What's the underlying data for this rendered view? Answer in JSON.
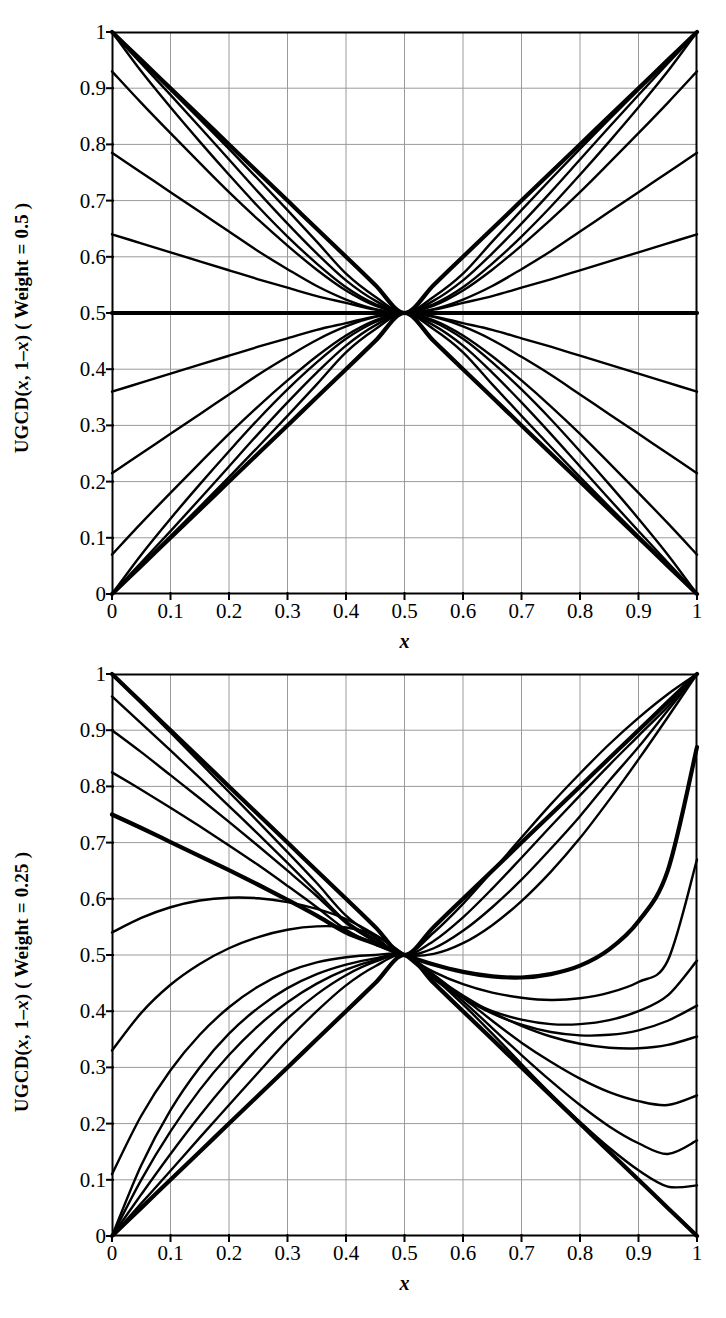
{
  "figures": [
    {
      "id": "top",
      "ylabel_prefix": "UGCD(",
      "ylabel_args_a": "x",
      "ylabel_comma": ", 1–",
      "ylabel_args_b": "x",
      "ylabel_suffix": ") ( Weight = 0.5 )",
      "xlabel": "x",
      "weight": "0.5"
    },
    {
      "id": "bottom",
      "ylabel_prefix": "UGCD(",
      "ylabel_args_a": "x",
      "ylabel_comma": ", 1–",
      "ylabel_args_b": "x",
      "ylabel_suffix": ") ( Weight = 0.25 )",
      "xlabel": "x",
      "weight": "0.25"
    }
  ],
  "axis": {
    "xticks": [
      "0",
      "0.1",
      "0.2",
      "0.3",
      "0.4",
      "0.5",
      "0.6",
      "0.7",
      "0.8",
      "0.9",
      "1"
    ],
    "yticks": [
      "0",
      "0.1",
      "0.2",
      "0.3",
      "0.4",
      "0.5",
      "0.6",
      "0.7",
      "0.8",
      "0.9",
      "1"
    ],
    "xlim": [
      0,
      1
    ],
    "ylim": [
      0,
      1
    ],
    "grid": true,
    "gridcolor": "#9a9a9a",
    "axiscolor": "#000000",
    "linecolor": "#000000"
  },
  "chart_data": [
    {
      "type": "line",
      "title": "",
      "xlabel": "x",
      "ylabel": "UGCD( x, 1–x ) ( Weight = 0.5 )",
      "xlim": [
        0,
        1
      ],
      "ylim": [
        0,
        1
      ],
      "grid": true,
      "legend": "none",
      "note": "Family of UGCD(x,1-x) aggregation curves for weight 0.5; all curves pass through the fixed point (0.5, 0.5). Curves are symmetric: the upper half descends from near (0,1) and the lower half rises from near (0,0).",
      "fixed_point": [
        0.5,
        0.5
      ],
      "x": [
        0,
        0.05,
        0.1,
        0.15,
        0.2,
        0.25,
        0.3,
        0.35,
        0.4,
        0.45,
        0.5,
        0.55,
        0.6,
        0.65,
        0.7,
        0.75,
        0.8,
        0.85,
        0.9,
        0.95,
        1
      ],
      "series": [
        {
          "name": "d-1 (pure disjunction, upper diagonal)",
          "thick": true,
          "values": [
            1,
            0.95,
            0.9,
            0.85,
            0.8,
            0.75,
            0.7,
            0.65,
            0.6,
            0.55,
            0.5,
            0.55,
            0.6,
            0.65,
            0.7,
            0.75,
            0.8,
            0.85,
            0.9,
            0.95,
            1
          ]
        },
        {
          "name": "d-2",
          "thick": false,
          "values": [
            1,
            0.949,
            0.897,
            0.845,
            0.792,
            0.738,
            0.683,
            0.627,
            0.57,
            0.529,
            0.5,
            0.529,
            0.57,
            0.627,
            0.683,
            0.738,
            0.792,
            0.845,
            0.897,
            0.949,
            1
          ]
        },
        {
          "name": "d-3",
          "thick": false,
          "values": [
            1,
            0.944,
            0.888,
            0.831,
            0.773,
            0.715,
            0.659,
            0.606,
            0.558,
            0.522,
            0.5,
            0.522,
            0.558,
            0.606,
            0.659,
            0.715,
            0.773,
            0.831,
            0.888,
            0.944,
            1
          ]
        },
        {
          "name": "d-4",
          "thick": false,
          "values": [
            1,
            0.93,
            0.866,
            0.805,
            0.746,
            0.689,
            0.636,
            0.588,
            0.546,
            0.516,
            0.5,
            0.516,
            0.546,
            0.588,
            0.636,
            0.689,
            0.746,
            0.805,
            0.866,
            0.93,
            1
          ]
        },
        {
          "name": "d-5",
          "thick": false,
          "values": [
            0.93,
            0.874,
            0.82,
            0.767,
            0.715,
            0.666,
            0.62,
            0.577,
            0.54,
            0.513,
            0.5,
            0.513,
            0.54,
            0.577,
            0.62,
            0.666,
            0.715,
            0.767,
            0.82,
            0.874,
            0.93
          ]
        },
        {
          "name": "d-6",
          "thick": false,
          "values": [
            0.785,
            0.75,
            0.715,
            0.68,
            0.645,
            0.61,
            0.578,
            0.548,
            0.524,
            0.507,
            0.5,
            0.507,
            0.524,
            0.548,
            0.578,
            0.61,
            0.645,
            0.68,
            0.715,
            0.75,
            0.785
          ]
        },
        {
          "name": "d-7",
          "thick": false,
          "values": [
            0.64,
            0.624,
            0.608,
            0.592,
            0.576,
            0.56,
            0.545,
            0.53,
            0.518,
            0.506,
            0.5,
            0.506,
            0.518,
            0.53,
            0.545,
            0.56,
            0.576,
            0.592,
            0.608,
            0.624,
            0.64
          ]
        },
        {
          "name": "neutral (constant 0.5)",
          "thick": true,
          "values": [
            0.5,
            0.5,
            0.5,
            0.5,
            0.5,
            0.5,
            0.5,
            0.5,
            0.5,
            0.5,
            0.5,
            0.5,
            0.5,
            0.5,
            0.5,
            0.5,
            0.5,
            0.5,
            0.5,
            0.5,
            0.5
          ]
        },
        {
          "name": "c-7",
          "thick": false,
          "values": [
            0.36,
            0.376,
            0.392,
            0.408,
            0.424,
            0.44,
            0.455,
            0.47,
            0.482,
            0.494,
            0.5,
            0.494,
            0.482,
            0.47,
            0.455,
            0.44,
            0.424,
            0.408,
            0.392,
            0.376,
            0.36
          ]
        },
        {
          "name": "c-6",
          "thick": false,
          "values": [
            0.215,
            0.25,
            0.285,
            0.32,
            0.355,
            0.39,
            0.422,
            0.452,
            0.476,
            0.493,
            0.5,
            0.493,
            0.476,
            0.452,
            0.422,
            0.39,
            0.355,
            0.32,
            0.285,
            0.25,
            0.215
          ]
        },
        {
          "name": "c-5",
          "thick": false,
          "values": [
            0.07,
            0.126,
            0.18,
            0.233,
            0.285,
            0.334,
            0.38,
            0.423,
            0.46,
            0.487,
            0.5,
            0.487,
            0.46,
            0.423,
            0.38,
            0.334,
            0.285,
            0.233,
            0.18,
            0.126,
            0.07
          ]
        },
        {
          "name": "c-4",
          "thick": false,
          "values": [
            0,
            0.07,
            0.134,
            0.195,
            0.254,
            0.311,
            0.364,
            0.412,
            0.454,
            0.484,
            0.5,
            0.484,
            0.454,
            0.412,
            0.364,
            0.311,
            0.254,
            0.195,
            0.134,
            0.07,
            0
          ]
        },
        {
          "name": "c-3",
          "thick": false,
          "values": [
            0,
            0.056,
            0.112,
            0.169,
            0.227,
            0.285,
            0.341,
            0.394,
            0.442,
            0.478,
            0.5,
            0.478,
            0.442,
            0.394,
            0.341,
            0.285,
            0.227,
            0.169,
            0.112,
            0.056,
            0
          ]
        },
        {
          "name": "c-2",
          "thick": false,
          "values": [
            0,
            0.051,
            0.103,
            0.155,
            0.208,
            0.262,
            0.317,
            0.373,
            0.43,
            0.471,
            0.5,
            0.471,
            0.43,
            0.373,
            0.317,
            0.262,
            0.208,
            0.155,
            0.103,
            0.051,
            0
          ]
        },
        {
          "name": "c-1 (pure conjunction, lower diagonal)",
          "thick": true,
          "values": [
            0,
            0.05,
            0.1,
            0.15,
            0.2,
            0.25,
            0.3,
            0.35,
            0.4,
            0.45,
            0.5,
            0.45,
            0.4,
            0.35,
            0.3,
            0.25,
            0.2,
            0.15,
            0.1,
            0.05,
            0
          ]
        }
      ]
    },
    {
      "type": "line",
      "title": "",
      "xlabel": "x",
      "ylabel": "UGCD( x, 1–x ) ( Weight = 0.25 )",
      "xlim": [
        0,
        1
      ],
      "ylim": [
        0,
        1
      ],
      "grid": true,
      "legend": "none",
      "note": "Family of UGCD(x,1-x) aggregation curves for weight 0.25; all curves pass through the fixed point (0.5, 0.5). Asymmetric weighting produces descending straight-ish lines from the upper left and hump/valley shaped curves.",
      "fixed_point": [
        0.5,
        0.5
      ],
      "x": [
        0,
        0.05,
        0.1,
        0.15,
        0.2,
        0.25,
        0.3,
        0.35,
        0.4,
        0.45,
        0.5,
        0.55,
        0.6,
        0.65,
        0.7,
        0.75,
        0.8,
        0.85,
        0.9,
        0.95,
        1
      ],
      "series": [
        {
          "name": "d-1 (upper diagonal)",
          "thick": true,
          "values": [
            1,
            0.95,
            0.9,
            0.85,
            0.8,
            0.75,
            0.7,
            0.65,
            0.6,
            0.55,
            0.5,
            0.55,
            0.6,
            0.65,
            0.7,
            0.75,
            0.8,
            0.85,
            0.9,
            0.95,
            1
          ]
        },
        {
          "name": "d-2",
          "thick": false,
          "values": [
            1,
            0.948,
            0.896,
            0.843,
            0.79,
            0.737,
            0.683,
            0.628,
            0.57,
            0.532,
            0.5,
            0.54,
            0.591,
            0.649,
            0.709,
            0.768,
            0.823,
            0.875,
            0.922,
            0.964,
            1
          ]
        },
        {
          "name": "d-3",
          "thick": false,
          "values": [
            0.96,
            0.912,
            0.864,
            0.815,
            0.765,
            0.715,
            0.664,
            0.612,
            0.56,
            0.528,
            0.5,
            0.525,
            0.567,
            0.618,
            0.673,
            0.729,
            0.784,
            0.838,
            0.89,
            0.942,
            1
          ]
        },
        {
          "name": "d-4",
          "thick": false,
          "values": [
            0.9,
            0.861,
            0.82,
            0.779,
            0.737,
            0.694,
            0.65,
            0.605,
            0.557,
            0.524,
            0.5,
            0.512,
            0.543,
            0.585,
            0.634,
            0.689,
            0.747,
            0.81,
            0.87,
            0.935,
            1
          ]
        },
        {
          "name": "d-5",
          "thick": false,
          "values": [
            0.825,
            0.794,
            0.762,
            0.729,
            0.695,
            0.66,
            0.623,
            0.585,
            0.545,
            0.519,
            0.5,
            0.502,
            0.521,
            0.553,
            0.596,
            0.648,
            0.708,
            0.776,
            0.848,
            0.923,
            1
          ]
        },
        {
          "name": "d-6 (thick, from 0.75)",
          "thick": true,
          "values": [
            0.75,
            0.726,
            0.701,
            0.676,
            0.651,
            0.625,
            0.598,
            0.57,
            0.54,
            0.52,
            0.5,
            0.483,
            0.47,
            0.462,
            0.46,
            0.466,
            0.481,
            0.51,
            0.56,
            0.65,
            0.87
          ]
        },
        {
          "name": "h-1 (hump from 0.54)",
          "thick": false,
          "values": [
            0.54,
            0.566,
            0.585,
            0.597,
            0.602,
            0.601,
            0.594,
            0.582,
            0.564,
            0.536,
            0.5,
            0.47,
            0.448,
            0.433,
            0.424,
            0.42,
            0.423,
            0.433,
            0.452,
            0.49,
            0.67
          ]
        },
        {
          "name": "h-2 (hump from 0.33)",
          "thick": false,
          "values": [
            0.33,
            0.397,
            0.447,
            0.484,
            0.512,
            0.532,
            0.545,
            0.551,
            0.549,
            0.535,
            0.5,
            0.457,
            0.424,
            0.4,
            0.385,
            0.377,
            0.377,
            0.384,
            0.4,
            0.428,
            0.49
          ]
        },
        {
          "name": "h-3 (hump from 0.11)",
          "thick": false,
          "values": [
            0.11,
            0.214,
            0.295,
            0.358,
            0.407,
            0.444,
            0.47,
            0.487,
            0.496,
            0.5,
            0.5,
            0.459,
            0.424,
            0.396,
            0.376,
            0.363,
            0.357,
            0.358,
            0.366,
            0.383,
            0.41
          ]
        },
        {
          "name": "h-4 (hump from 0)",
          "thick": false,
          "values": [
            0,
            0.126,
            0.224,
            0.3,
            0.36,
            0.406,
            0.441,
            0.466,
            0.483,
            0.494,
            0.5,
            0.462,
            0.428,
            0.398,
            0.374,
            0.355,
            0.342,
            0.335,
            0.334,
            0.34,
            0.355
          ]
        },
        {
          "name": "c-4",
          "thick": false,
          "values": [
            0,
            0.1,
            0.186,
            0.26,
            0.322,
            0.374,
            0.416,
            0.449,
            0.474,
            0.491,
            0.5,
            0.465,
            0.424,
            0.383,
            0.344,
            0.31,
            0.28,
            0.256,
            0.24,
            0.233,
            0.25
          ]
        },
        {
          "name": "c-3",
          "thick": false,
          "values": [
            0,
            0.074,
            0.146,
            0.214,
            0.277,
            0.335,
            0.387,
            0.43,
            0.464,
            0.488,
            0.5,
            0.462,
            0.418,
            0.37,
            0.322,
            0.276,
            0.233,
            0.195,
            0.165,
            0.146,
            0.17
          ]
        },
        {
          "name": "c-2",
          "thick": false,
          "values": [
            0,
            0.058,
            0.116,
            0.175,
            0.233,
            0.291,
            0.348,
            0.4,
            0.446,
            0.48,
            0.5,
            0.46,
            0.412,
            0.36,
            0.306,
            0.253,
            0.203,
            0.157,
            0.117,
            0.088,
            0.09
          ]
        },
        {
          "name": "c-1 (lower diagonal)",
          "thick": true,
          "values": [
            0,
            0.05,
            0.1,
            0.15,
            0.2,
            0.25,
            0.3,
            0.35,
            0.4,
            0.45,
            0.5,
            0.45,
            0.4,
            0.35,
            0.3,
            0.25,
            0.2,
            0.15,
            0.1,
            0.05,
            0
          ]
        }
      ]
    }
  ]
}
